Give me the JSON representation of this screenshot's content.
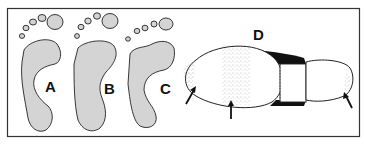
{
  "figure": {
    "panels": [
      {
        "id": "A",
        "label": "A",
        "subject": "footprint"
      },
      {
        "id": "B",
        "label": "B",
        "subject": "footprint"
      },
      {
        "id": "C",
        "label": "C",
        "subject": "footprint"
      },
      {
        "id": "D",
        "label": "D",
        "subject": "shoe-sole-wear"
      }
    ],
    "arrows_count": 3,
    "colors": {
      "border": "#333333",
      "foot_fill": "#d4d4d4",
      "outline": "#222222",
      "shoe_dark": "#111111",
      "background": "#ffffff"
    }
  }
}
